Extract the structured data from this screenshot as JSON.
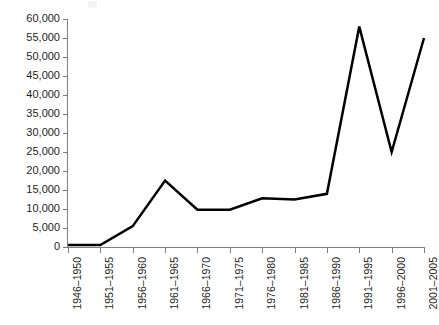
{
  "chart_data": {
    "type": "line",
    "title": "",
    "subtitle": "",
    "xlabel": "",
    "ylabel": "",
    "categories": [
      "1946–1950",
      "1951–1955",
      "1956–1960",
      "1961–1965",
      "1966–1970",
      "1971–1975",
      "1976–1980",
      "1981–1985",
      "1986–1990",
      "1991–1995",
      "1996–2000",
      "2001–2005"
    ],
    "values": [
      500,
      500,
      5500,
      17500,
      9800,
      9800,
      12800,
      12500,
      14000,
      58000,
      25000,
      55000
    ],
    "series": [
      {
        "name": "series-1",
        "color": "#000000",
        "values": [
          500,
          500,
          5500,
          17500,
          9800,
          9800,
          12800,
          12500,
          14000,
          58000,
          25000,
          55000
        ]
      }
    ],
    "ylim": [
      0,
      60000
    ],
    "ytick_values": [
      0,
      5000,
      10000,
      15000,
      20000,
      25000,
      30000,
      35000,
      40000,
      45000,
      50000,
      55000,
      60000
    ],
    "ytick_labels": [
      "0",
      "5,000",
      "10,000",
      "15,000",
      "20,000",
      "25,000",
      "30,000",
      "35,000",
      "40,000",
      "45,000",
      "50,000",
      "55,000",
      "60,000"
    ],
    "grid": false,
    "legend": false,
    "legend_position": "none",
    "markers": false,
    "xtick_rotation": 90,
    "line_width": 2.5,
    "axis_color": "#808080",
    "text_color": "#231f20",
    "background": "#ffffff"
  }
}
